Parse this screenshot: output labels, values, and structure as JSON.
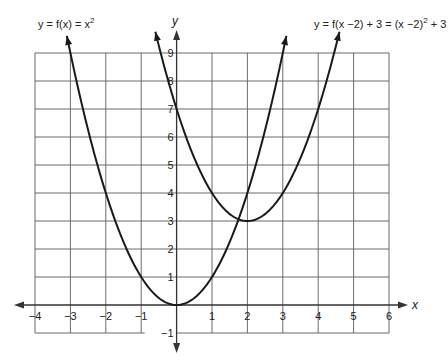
{
  "chart_data": {
    "type": "line",
    "title": "",
    "xlabel": "x",
    "ylabel": "y",
    "xlim": [
      -4,
      6
    ],
    "ylim": [
      -1,
      9
    ],
    "grid": true,
    "x_ticks": [
      -4,
      -3,
      -2,
      -1,
      1,
      2,
      3,
      4,
      5,
      6
    ],
    "y_ticks": [
      -1,
      1,
      2,
      3,
      4,
      5,
      6,
      7,
      8,
      9
    ],
    "x_tick_labels": [
      "−4",
      "−3",
      "−2",
      "−1",
      "1",
      "2",
      "3",
      "4",
      "5",
      "6"
    ],
    "y_tick_labels": [
      "−1",
      "1",
      "2",
      "3",
      "4",
      "5",
      "6",
      "7",
      "8",
      "9"
    ],
    "series": [
      {
        "name": "y = f(x) = x²",
        "formula": "x^2",
        "x": [
          -3.1,
          -3,
          -2,
          -1,
          0,
          1,
          2,
          3,
          3.1
        ],
        "values": [
          9.61,
          9,
          4,
          1,
          0,
          1,
          4,
          9,
          9.61
        ],
        "vertex": [
          0,
          0
        ],
        "arrows": "both-ends"
      },
      {
        "name": "y = f(x − 2) + 3 = (x − 2)² + 3",
        "formula": "(x-2)^2+3",
        "x": [
          -0.6,
          -0.5,
          0,
          1,
          2,
          3,
          4,
          4.5,
          4.6
        ],
        "values": [
          9.76,
          9.25,
          7,
          4,
          3,
          4,
          7,
          9.25,
          9.76
        ],
        "vertex": [
          2,
          3
        ],
        "arrows": "both-ends"
      }
    ],
    "annotations": [
      {
        "text_parts": [
          "y",
          " = ",
          "f",
          "(",
          "x",
          ") = ",
          "x",
          "2"
        ],
        "label": "y = f(x) = x²",
        "position": "upper-left"
      },
      {
        "label": "y = f(x − 2) + 3 = (x − 2)² + 3",
        "position": "upper-right"
      }
    ]
  },
  "labels": {
    "eq1_prefix": "y = f(x) = x",
    "eq1_exp": "2",
    "eq2_prefix": "y = f(x −2) + 3 = (x −2)",
    "eq2_exp": "2",
    "eq2_suffix": " + 3",
    "x_axis": "x",
    "y_axis": "y"
  },
  "style": {
    "curve_color": "#1a1a1a",
    "grid_color": "#6b6b6b",
    "axis_color": "#333333"
  }
}
